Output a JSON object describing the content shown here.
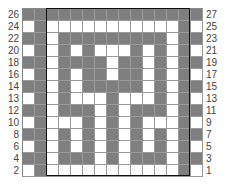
{
  "chart_data": {
    "type": "heatmap",
    "title": "",
    "columns": 15,
    "rows": 14,
    "left_labels": [
      "26",
      "24",
      "22",
      "20",
      "18",
      "16",
      "14",
      "13",
      "12",
      "10",
      "8",
      "6",
      "4",
      "2"
    ],
    "right_labels": [
      "27",
      "25",
      "23",
      "21",
      "19",
      "17",
      "15",
      "13",
      "11",
      "9",
      "7",
      "5",
      "3",
      "1"
    ],
    "colors": {
      "filled": "#7f7f7f",
      "empty": "#ffffff",
      "gridline": "#9a9a9a",
      "frame": "#111111"
    },
    "cells": [
      [
        1,
        1,
        1,
        1,
        1,
        1,
        1,
        1,
        1,
        1,
        1,
        1,
        1,
        1,
        1
      ],
      [
        0,
        1,
        0,
        0,
        0,
        0,
        0,
        0,
        0,
        0,
        0,
        0,
        0,
        1,
        0
      ],
      [
        1,
        1,
        0,
        1,
        1,
        1,
        1,
        1,
        1,
        1,
        1,
        1,
        0,
        1,
        1
      ],
      [
        0,
        1,
        0,
        1,
        0,
        1,
        0,
        0,
        0,
        1,
        0,
        1,
        0,
        1,
        0
      ],
      [
        1,
        1,
        0,
        1,
        1,
        1,
        1,
        0,
        1,
        1,
        0,
        1,
        0,
        1,
        1
      ],
      [
        0,
        1,
        0,
        1,
        0,
        1,
        1,
        0,
        1,
        1,
        0,
        1,
        0,
        1,
        0
      ],
      [
        1,
        1,
        0,
        1,
        0,
        1,
        1,
        1,
        1,
        1,
        0,
        1,
        0,
        1,
        1
      ],
      [
        0,
        1,
        0,
        1,
        0,
        0,
        0,
        1,
        0,
        0,
        0,
        1,
        0,
        1,
        0
      ],
      [
        1,
        1,
        0,
        1,
        1,
        1,
        0,
        1,
        0,
        1,
        1,
        1,
        0,
        1,
        1
      ],
      [
        0,
        1,
        0,
        0,
        0,
        1,
        0,
        1,
        0,
        1,
        0,
        0,
        0,
        1,
        0
      ],
      [
        1,
        1,
        0,
        1,
        0,
        1,
        0,
        1,
        0,
        1,
        0,
        1,
        0,
        1,
        1
      ],
      [
        0,
        1,
        0,
        1,
        0,
        1,
        0,
        1,
        0,
        1,
        0,
        1,
        0,
        1,
        0
      ],
      [
        1,
        1,
        0,
        1,
        1,
        1,
        0,
        1,
        0,
        1,
        1,
        1,
        0,
        1,
        1
      ],
      [
        0,
        1,
        0,
        0,
        0,
        0,
        0,
        0,
        0,
        0,
        0,
        0,
        0,
        1,
        0
      ]
    ]
  }
}
